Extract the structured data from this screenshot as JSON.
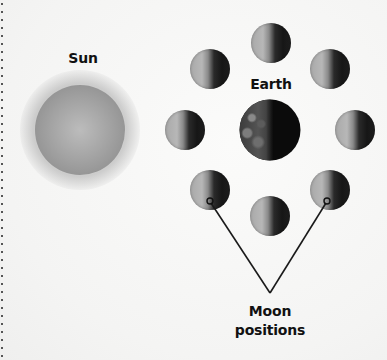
{
  "diagram": {
    "labels": {
      "sun": "Sun",
      "earth": "Earth",
      "moon_positions_line1": "Moon",
      "moon_positions_line2": "positions"
    },
    "colors": {
      "background": "#f7f7f6",
      "sun": "#a4a4a4",
      "moon_lit": "#b0b0b0",
      "moon_dark": "#161616",
      "earth_dark": "#0b0b0b",
      "pointer_line": "#1a1a1a"
    },
    "moons": [
      {
        "position": "top",
        "x": 271,
        "y": 43
      },
      {
        "position": "upper-right",
        "x": 330,
        "y": 69
      },
      {
        "position": "right",
        "x": 355,
        "y": 130
      },
      {
        "position": "lower-right",
        "x": 330,
        "y": 190
      },
      {
        "position": "bottom",
        "x": 270,
        "y": 216
      },
      {
        "position": "lower-left",
        "x": 210,
        "y": 190
      },
      {
        "position": "left",
        "x": 185,
        "y": 130
      },
      {
        "position": "upper-left",
        "x": 210,
        "y": 69
      }
    ]
  }
}
